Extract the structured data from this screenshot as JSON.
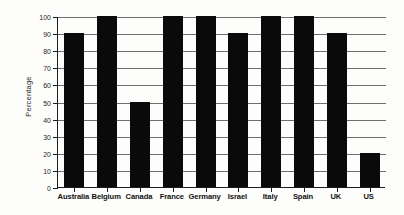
{
  "chart_data": {
    "type": "bar",
    "title": "",
    "xlabel": "",
    "ylabel": "Percentage",
    "categories": [
      "Australia",
      "Belgium",
      "Canada",
      "France",
      "Germany",
      "Israel",
      "Italy",
      "Spain",
      "UK",
      "US"
    ],
    "values": [
      90,
      100,
      50,
      100,
      100,
      90,
      100,
      100,
      90,
      20
    ],
    "ylim": [
      0,
      100
    ],
    "ytick_labels": [
      "0",
      "10",
      "20",
      "30",
      "40",
      "50",
      "60",
      "70",
      "80",
      "90",
      "100"
    ],
    "ytick_values": [
      0,
      10,
      20,
      30,
      40,
      50,
      60,
      70,
      80,
      90,
      100
    ],
    "grid": true,
    "legend": false,
    "bar_color": "#0a0a0a",
    "grid_color": "#6e6e6e",
    "axis_color": "#1c1c1c",
    "background_color": "#fdfdfb"
  }
}
